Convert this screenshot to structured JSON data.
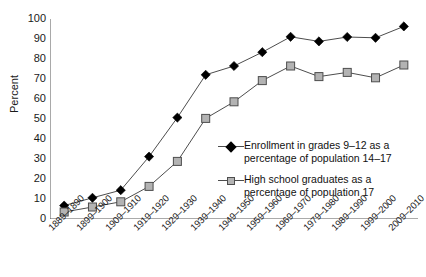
{
  "chart_data": {
    "type": "line",
    "title": "",
    "xlabel": "",
    "ylabel": "Percent",
    "ylim": [
      0,
      100
    ],
    "ytick_step": 10,
    "grid": false,
    "legend_position": "inside-right",
    "yticks": [
      "100",
      "90",
      "80",
      "70",
      "60",
      "50",
      "40",
      "30",
      "20",
      "10",
      "0"
    ],
    "categories": [
      "1889–1890",
      "1899–1900",
      "1909–1910",
      "1919–1920",
      "1929–1930",
      "1939–1940",
      "1949–1950",
      "1959–1960",
      "1969–1970",
      "1979–1980",
      "1989–1990",
      "1999–2000",
      "2009–2010"
    ],
    "series": [
      {
        "name": "Enrollment in grades 9–12 as a percentage of population 14–17",
        "legend_line_1": "Enrollment in grades 9–12 as a",
        "legend_line_2": "percentage of population 14–17",
        "marker": "diamond",
        "color": "#000000",
        "line_color": "#4d4d4d",
        "values": [
          6.7,
          10.6,
          14.4,
          31.2,
          50.7,
          72.1,
          76.5,
          83.4,
          91.1,
          88.8,
          91.0,
          90.6,
          96.3
        ]
      },
      {
        "name": "High school graduates as a percentage of population 17",
        "legend_line_1": "High school graduates as a",
        "legend_line_2": "percentage of population 17",
        "marker": "square",
        "color": "#b3b3b3",
        "line_color": "#4d4d4d",
        "values": [
          3.5,
          6.0,
          8.6,
          16.3,
          28.8,
          50.3,
          58.6,
          69.2,
          76.5,
          71.2,
          73.3,
          70.6,
          77.0
        ]
      }
    ]
  }
}
